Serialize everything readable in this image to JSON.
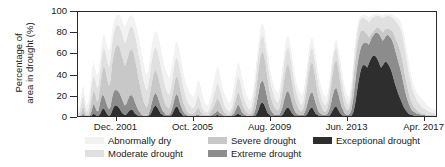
{
  "chart_data": {
    "type": "area",
    "title": "",
    "xlabel": "",
    "ylabel": "Percentage of area in drought (%)",
    "ylim": [
      0,
      100
    ],
    "yticks": [
      0,
      20,
      40,
      60,
      80,
      100
    ],
    "xticklabels": [
      "Dec. 2001",
      "Oct. 2005",
      "Aug. 2009",
      "Jun. 2013",
      "Apr. 2017"
    ],
    "xtick_months": [
      23,
      69,
      115,
      161,
      207
    ],
    "x_range_months": [
      0,
      215
    ],
    "x_start": "Jan. 2000",
    "x_end": "Dec. 2017",
    "grid": false,
    "stacked": true,
    "legend_position": "bottom",
    "legend_ncol": 3,
    "series": [
      {
        "name": "Abnormally dry",
        "color": "#f2f2f2",
        "values": [
          6,
          10,
          22,
          30,
          18,
          10,
          14,
          26,
          44,
          52,
          46,
          38,
          44,
          58,
          72,
          80,
          74,
          66,
          62,
          70,
          84,
          92,
          96,
          97,
          97,
          95,
          90,
          86,
          88,
          93,
          96,
          97,
          96,
          92,
          86,
          78,
          70,
          60,
          52,
          44,
          40,
          46,
          58,
          70,
          78,
          82,
          80,
          74,
          66,
          58,
          50,
          44,
          40,
          36,
          42,
          52,
          64,
          72,
          70,
          62,
          54,
          44,
          36,
          30,
          26,
          22,
          20,
          18,
          22,
          30,
          36,
          30,
          22,
          16,
          12,
          10,
          12,
          18,
          26,
          34,
          42,
          48,
          44,
          36,
          28,
          22,
          18,
          14,
          12,
          16,
          24,
          34,
          44,
          52,
          48,
          40,
          32,
          26,
          20,
          16,
          14,
          18,
          28,
          42,
          58,
          72,
          84,
          90,
          86,
          76,
          64,
          52,
          42,
          34,
          28,
          24,
          22,
          26,
          36,
          50,
          64,
          74,
          78,
          72,
          62,
          50,
          40,
          32,
          26,
          22,
          20,
          24,
          34,
          48,
          62,
          72,
          76,
          70,
          60,
          48,
          38,
          30,
          24,
          20,
          18,
          22,
          32,
          46,
          60,
          70,
          74,
          68,
          58,
          46,
          36,
          28,
          22,
          18,
          22,
          34,
          52,
          70,
          84,
          92,
          96,
          97,
          97,
          97,
          96,
          95,
          96,
          97,
          98,
          98,
          98,
          98,
          97,
          97,
          98,
          98,
          98,
          98,
          98,
          97,
          96,
          95,
          94,
          92,
          88,
          82,
          74,
          64,
          54,
          44,
          36,
          30,
          26,
          22,
          20,
          18,
          16,
          14,
          12,
          10,
          9,
          8,
          7,
          6,
          6
        ]
      },
      {
        "name": "Moderate drought",
        "color": "#e0e0e0",
        "values": [
          2,
          4,
          12,
          20,
          10,
          4,
          6,
          14,
          30,
          38,
          34,
          26,
          30,
          44,
          58,
          66,
          60,
          52,
          46,
          54,
          70,
          80,
          86,
          88,
          86,
          82,
          76,
          70,
          72,
          78,
          84,
          86,
          84,
          78,
          70,
          60,
          52,
          42,
          34,
          28,
          24,
          30,
          42,
          54,
          62,
          66,
          62,
          56,
          48,
          40,
          32,
          26,
          22,
          20,
          26,
          36,
          48,
          56,
          54,
          46,
          38,
          28,
          22,
          16,
          12,
          10,
          8,
          7,
          10,
          16,
          20,
          14,
          8,
          5,
          4,
          3,
          5,
          9,
          14,
          20,
          26,
          32,
          28,
          22,
          16,
          10,
          7,
          5,
          4,
          6,
          12,
          20,
          30,
          38,
          34,
          26,
          18,
          14,
          10,
          7,
          6,
          9,
          18,
          30,
          46,
          60,
          72,
          78,
          74,
          64,
          52,
          40,
          30,
          24,
          18,
          14,
          12,
          16,
          26,
          38,
          52,
          62,
          66,
          60,
          50,
          38,
          28,
          22,
          16,
          12,
          10,
          14,
          24,
          38,
          52,
          62,
          66,
          58,
          48,
          36,
          26,
          20,
          14,
          11,
          10,
          14,
          24,
          38,
          52,
          62,
          66,
          58,
          48,
          36,
          26,
          18,
          13,
          10,
          14,
          26,
          44,
          62,
          76,
          86,
          92,
          94,
          94,
          93,
          92,
          90,
          92,
          94,
          95,
          96,
          96,
          96,
          95,
          94,
          95,
          96,
          96,
          96,
          95,
          94,
          92,
          90,
          88,
          85,
          80,
          72,
          62,
          52,
          42,
          34,
          27,
          22,
          18,
          14,
          12,
          10,
          8,
          7,
          6,
          5,
          4,
          4,
          3,
          3
        ]
      },
      {
        "name": "Severe drought",
        "color": "#c8c8c8",
        "values": [
          0,
          0,
          4,
          9,
          3,
          1,
          1,
          5,
          16,
          24,
          20,
          13,
          16,
          28,
          40,
          48,
          42,
          34,
          28,
          34,
          50,
          60,
          66,
          68,
          66,
          60,
          54,
          48,
          50,
          56,
          62,
          64,
          62,
          54,
          46,
          36,
          28,
          20,
          14,
          10,
          8,
          12,
          22,
          32,
          40,
          44,
          40,
          34,
          26,
          20,
          14,
          10,
          8,
          7,
          12,
          20,
          30,
          38,
          36,
          28,
          20,
          13,
          9,
          5,
          3,
          2,
          2,
          2,
          3,
          6,
          8,
          4,
          2,
          1,
          1,
          1,
          1,
          3,
          6,
          9,
          13,
          17,
          14,
          10,
          6,
          3,
          2,
          1,
          1,
          2,
          5,
          10,
          17,
          23,
          19,
          13,
          8,
          5,
          3,
          2,
          2,
          3,
          8,
          17,
          30,
          44,
          56,
          62,
          58,
          48,
          36,
          25,
          17,
          12,
          8,
          6,
          5,
          7,
          14,
          24,
          36,
          46,
          50,
          44,
          34,
          24,
          16,
          11,
          7,
          5,
          4,
          7,
          14,
          25,
          38,
          48,
          52,
          44,
          34,
          23,
          15,
          10,
          6,
          4,
          4,
          7,
          14,
          26,
          40,
          50,
          54,
          46,
          35,
          24,
          15,
          9,
          6,
          5,
          8,
          17,
          33,
          50,
          64,
          74,
          80,
          82,
          82,
          80,
          78,
          75,
          78,
          80,
          82,
          84,
          85,
          84,
          82,
          80,
          82,
          84,
          84,
          83,
          82,
          80,
          76,
          72,
          68,
          63,
          56,
          47,
          38,
          29,
          22,
          16,
          12,
          9,
          7,
          5,
          4,
          3,
          2,
          2,
          1,
          1,
          1,
          1,
          1
        ]
      },
      {
        "name": "Extreme drought",
        "color": "#8c8c8c",
        "values": [
          0,
          0,
          0,
          2,
          0,
          0,
          0,
          0,
          5,
          11,
          8,
          4,
          5,
          13,
          20,
          19,
          14,
          9,
          6,
          9,
          18,
          24,
          25,
          24,
          22,
          18,
          14,
          10,
          11,
          15,
          19,
          20,
          18,
          13,
          9,
          5,
          3,
          1,
          0,
          0,
          0,
          1,
          6,
          13,
          19,
          22,
          19,
          14,
          9,
          5,
          3,
          1,
          1,
          1,
          3,
          8,
          15,
          21,
          19,
          13,
          8,
          4,
          2,
          1,
          0,
          0,
          0,
          0,
          0,
          1,
          1,
          0,
          0,
          0,
          0,
          0,
          0,
          0,
          1,
          2,
          3,
          5,
          3,
          2,
          1,
          0,
          0,
          0,
          0,
          0,
          1,
          3,
          7,
          11,
          8,
          4,
          2,
          1,
          0,
          0,
          0,
          0,
          1,
          5,
          13,
          22,
          31,
          34,
          31,
          24,
          16,
          9,
          5,
          3,
          1,
          1,
          1,
          1,
          4,
          9,
          16,
          22,
          24,
          20,
          14,
          8,
          4,
          2,
          1,
          1,
          1,
          1,
          4,
          9,
          16,
          21,
          23,
          18,
          12,
          7,
          3,
          2,
          1,
          1,
          1,
          2,
          5,
          11,
          19,
          25,
          27,
          22,
          15,
          9,
          5,
          2,
          1,
          1,
          2,
          6,
          16,
          30,
          44,
          55,
          63,
          68,
          70,
          70,
          70,
          68,
          72,
          76,
          78,
          80,
          80,
          78,
          75,
          72,
          74,
          77,
          78,
          76,
          74,
          70,
          64,
          58,
          52,
          46,
          39,
          31,
          23,
          17,
          12,
          8,
          5,
          4,
          3,
          2,
          2,
          1,
          1,
          1,
          0,
          0,
          0,
          0
        ]
      },
      {
        "name": "Exceptional drought",
        "color": "#2e2e2e",
        "values": [
          0,
          0,
          0,
          0,
          0,
          0,
          0,
          0,
          0,
          2,
          1,
          0,
          0,
          2,
          6,
          7,
          4,
          1,
          0,
          1,
          5,
          9,
          10,
          9,
          7,
          4,
          2,
          1,
          1,
          3,
          5,
          6,
          5,
          2,
          1,
          0,
          0,
          0,
          0,
          0,
          0,
          0,
          1,
          4,
          8,
          10,
          8,
          5,
          2,
          1,
          0,
          0,
          0,
          0,
          0,
          2,
          6,
          9,
          8,
          4,
          2,
          0,
          0,
          0,
          0,
          0,
          0,
          0,
          0,
          0,
          0,
          0,
          0,
          0,
          0,
          0,
          0,
          0,
          0,
          0,
          0,
          1,
          0,
          0,
          0,
          0,
          0,
          0,
          0,
          0,
          0,
          0,
          1,
          2,
          1,
          0,
          0,
          0,
          0,
          0,
          0,
          0,
          0,
          0,
          2,
          6,
          11,
          13,
          11,
          7,
          3,
          1,
          0,
          0,
          0,
          0,
          0,
          0,
          0,
          1,
          4,
          7,
          8,
          6,
          3,
          1,
          0,
          0,
          0,
          0,
          0,
          0,
          0,
          1,
          4,
          7,
          8,
          5,
          2,
          1,
          0,
          0,
          0,
          0,
          0,
          0,
          0,
          2,
          5,
          8,
          9,
          6,
          3,
          1,
          0,
          0,
          0,
          0,
          0,
          0,
          3,
          10,
          21,
          32,
          41,
          47,
          49,
          48,
          46,
          50,
          54,
          57,
          58,
          57,
          54,
          50,
          46,
          48,
          51,
          52,
          50,
          47,
          43,
          37,
          31,
          26,
          21,
          17,
          13,
          9,
          6,
          4,
          2,
          1,
          1,
          0,
          0,
          0,
          0,
          0,
          0,
          0,
          0,
          0
        ]
      }
    ]
  },
  "axes": {
    "ylabel_line1": "Percentage of",
    "ylabel_line2": "area in drought (%)",
    "ytick_labels": [
      "0",
      "20",
      "40",
      "60",
      "80",
      "100"
    ],
    "xtick_labels": [
      "Dec. 2001",
      "Oct. 2005",
      "Aug. 2009",
      "Jun. 2013",
      "Apr. 2017"
    ]
  },
  "legend": {
    "items": [
      {
        "label": "Abnormally dry",
        "color": "#f2f2f2"
      },
      {
        "label": "Moderate drought",
        "color": "#e0e0e0"
      },
      {
        "label": "Severe drought",
        "color": "#c8c8c8"
      },
      {
        "label": "Extreme drought",
        "color": "#8c8c8c"
      },
      {
        "label": "Exceptional drought",
        "color": "#2e2e2e"
      }
    ]
  }
}
